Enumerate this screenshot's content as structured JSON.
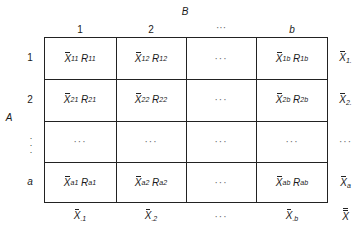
{
  "factor_b": {
    "label": "B",
    "levels": [
      "1",
      "2",
      "···",
      "b"
    ]
  },
  "factor_a": {
    "label": "A",
    "levels": [
      "1",
      "2",
      "⋮",
      "a"
    ]
  },
  "cells": [
    [
      {
        "x": "X",
        "xs": "11",
        "r": "R",
        "rs": "11"
      },
      {
        "x": "X",
        "xs": "12",
        "r": "R",
        "rs": "12"
      },
      {
        "dots": "···"
      },
      {
        "x": "X",
        "xs": "1b",
        "r": "R",
        "rs": "1b"
      }
    ],
    [
      {
        "x": "X",
        "xs": "21",
        "r": "R",
        "rs": "21"
      },
      {
        "x": "X",
        "xs": "22",
        "r": "R",
        "rs": "22"
      },
      {
        "dots": "···"
      },
      {
        "x": "X",
        "xs": "2b",
        "r": "R",
        "rs": "2b"
      }
    ],
    [
      {
        "dots": "···"
      },
      {
        "dots": "···"
      },
      {
        "dots": "···"
      },
      {
        "dots": "···"
      }
    ],
    [
      {
        "x": "X",
        "xs": "a1",
        "r": "R",
        "rs": "a1"
      },
      {
        "x": "X",
        "xs": "a2",
        "r": "R",
        "rs": "a2"
      },
      {
        "dots": "···"
      },
      {
        "x": "X",
        "xs": "ab",
        "r": "R",
        "rs": "ab"
      }
    ]
  ],
  "row_means": [
    {
      "x": "X",
      "s": "1."
    },
    {
      "x": "X",
      "s": "2."
    },
    {
      "dots": "···"
    },
    {
      "x": "X",
      "s": "a"
    }
  ],
  "col_means": [
    {
      "x": "X",
      "s": ".1"
    },
    {
      "x": "X",
      "s": ".2"
    },
    {
      "dots": "···"
    },
    {
      "x": "X",
      "s": ".b"
    }
  ],
  "grand_mean": {
    "x": "X"
  }
}
